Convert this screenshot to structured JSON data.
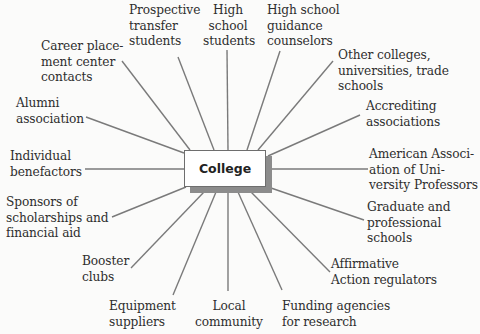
{
  "diagram": {
    "center": "College",
    "colors": {
      "line": "#7a7a7a",
      "text": "#2e2e2e",
      "background": "#fbfbfa",
      "box_shadow": "#8c8c8c"
    },
    "stakeholders": [
      {
        "id": "career-placement",
        "label": "Career place-\nment center\ncontacts"
      },
      {
        "id": "prospective-transfer",
        "label": "Prospective\ntransfer\nstudents"
      },
      {
        "id": "high-school-students",
        "label": "High\nschool\nstudents"
      },
      {
        "id": "hs-guidance",
        "label": "High school\nguidance\ncounselors"
      },
      {
        "id": "other-colleges",
        "label": "Other colleges,\nuniversities, trade\nschools"
      },
      {
        "id": "accrediting",
        "label": "Accrediting\nassociations"
      },
      {
        "id": "aaup",
        "label": "American Associ-\nation of Uni-\nversity Professors"
      },
      {
        "id": "graduate-schools",
        "label": "Graduate and\nprofessional\nschools"
      },
      {
        "id": "affirmative-action",
        "label": "Affirmative\nAction regulators"
      },
      {
        "id": "funding-agencies",
        "label": "Funding agencies\nfor research"
      },
      {
        "id": "local-community",
        "label": "Local\ncommunity"
      },
      {
        "id": "equipment-suppliers",
        "label": "Equipment\nsuppliers"
      },
      {
        "id": "booster-clubs",
        "label": "Booster\nclubs"
      },
      {
        "id": "sponsors",
        "label": "Sponsors of\nscholarships and\nfinancial aid"
      },
      {
        "id": "individual-benefactors",
        "label": "Individual\nbenefactors"
      },
      {
        "id": "alumni",
        "label": "Alumni\nassociation"
      }
    ]
  }
}
